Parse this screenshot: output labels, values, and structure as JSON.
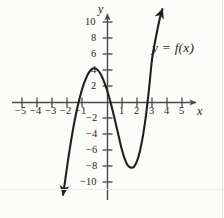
{
  "figure": {
    "title": "",
    "curve_label": "y = f(x)",
    "x_axis_name": "x",
    "y_axis_name": "y",
    "ink_color": "#231f20",
    "axis_color": "#4a4a4a",
    "background_color": "#fcfcfb"
  },
  "chart_data": {
    "type": "line",
    "title": "",
    "subtitle": "",
    "xlabel": "x",
    "ylabel": "y",
    "xlim": [
      -5.8,
      6.0
    ],
    "ylim": [
      -11.5,
      11.5
    ],
    "xticks": [
      -5,
      -4,
      -3,
      -2,
      -1,
      1,
      2,
      3,
      4,
      5
    ],
    "xticklabels": [
      "−5",
      "−4",
      "−3",
      "−2",
      "−1",
      "1",
      "2",
      "3",
      "4",
      "5"
    ],
    "yticks": [
      10,
      8,
      6,
      4,
      2,
      -2,
      -4,
      -6,
      -8,
      -10
    ],
    "yticklabels": [
      "10",
      "8",
      "6",
      "4",
      "2",
      "−2",
      "−4",
      "−6",
      "−8",
      "−10"
    ],
    "grid": false,
    "legend": null,
    "annotations": [
      {
        "text": "y = f(x)",
        "x": 3.0,
        "y": 6.2
      }
    ],
    "series": [
      {
        "name": "y = f(x)",
        "color": "#231f20",
        "arrow_start": true,
        "arrow_end": true,
        "x": [
          -2.93,
          -2.8,
          -2.6,
          -2.4,
          -2.2,
          -2.0,
          -1.8,
          -1.6,
          -1.4,
          -1.2,
          -1.0,
          -0.8,
          -0.6,
          -0.4,
          -0.2,
          0.0,
          0.2,
          0.4,
          0.6,
          0.8,
          1.0,
          1.2,
          1.4,
          1.6,
          1.8,
          2.0,
          2.2,
          2.4,
          2.6,
          2.8,
          3.0,
          3.2,
          3.4,
          3.6,
          3.7
        ],
        "y": [
          -11.6,
          -9.95,
          -7.3,
          -4.9,
          -2.75,
          -0.9,
          0.65,
          1.95,
          2.95,
          3.7,
          4.15,
          4.2,
          3.95,
          3.4,
          2.55,
          1.5,
          0.2,
          -1.25,
          -2.85,
          -4.45,
          -6.0,
          -7.2,
          -7.95,
          -8.2,
          -8.1,
          -7.4,
          -6.1,
          -4.2,
          -1.65,
          1.6,
          5.3,
          7.5,
          9.4,
          11.1,
          11.6
        ],
        "features": {
          "local_maximum": {
            "x": -0.85,
            "y": 4.2
          },
          "local_minimum": {
            "x": 1.7,
            "y": -8.2
          },
          "x_intercepts": [
            -2.05,
            0.25,
            2.85
          ],
          "y_intercept": 1.5
        }
      }
    ]
  },
  "ticks_px": {
    "origin_x": 107,
    "origin_y": 102,
    "unit_x": 15,
    "unit_y": 8
  }
}
